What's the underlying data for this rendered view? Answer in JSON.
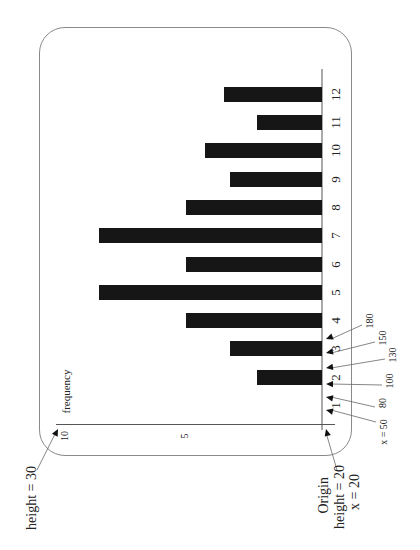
{
  "chart_data": {
    "type": "bar",
    "orientation": "horizontal (rotated page; bars extend left from baseline)",
    "title": "",
    "xlabel": "",
    "ylabel": "frequency",
    "categories": [
      "1",
      "2",
      "3",
      "4",
      "5",
      "6",
      "7",
      "8",
      "9",
      "10",
      "11",
      "12"
    ],
    "values": [
      0,
      2.4,
      3.4,
      5,
      8.2,
      5,
      8.2,
      5,
      3.4,
      4.3,
      2.4,
      3.6
    ],
    "ylim": [
      0,
      10
    ],
    "yticks": [
      "5",
      "10"
    ],
    "grid": false,
    "legend": null,
    "annotations": [
      {
        "text": "height = 30",
        "target": "top of frequency axis (10)"
      },
      {
        "text": "Origin",
        "target": "origin"
      },
      {
        "text": "height = 20",
        "target": "origin"
      },
      {
        "text": "x = 20",
        "target": "origin"
      },
      {
        "text": "x = 50",
        "target": "x position"
      },
      {
        "text": "80",
        "target": "x position"
      },
      {
        "text": "100",
        "target": "x position"
      },
      {
        "text": "130",
        "target": "x position"
      },
      {
        "text": "150",
        "target": "x position"
      },
      {
        "text": "180",
        "target": "x position"
      }
    ]
  },
  "axis": {
    "freq_label": "frequency",
    "tick_5": "5",
    "tick_10": "10"
  },
  "annotations": {
    "height_top": "height = 30",
    "origin": "Origin",
    "origin_height": "height = 20",
    "origin_x": "x = 20",
    "x_positions": [
      {
        "label": "x = 50",
        "arrow_y": 410,
        "text_x": 384,
        "text_y": 432
      },
      {
        "label": "80",
        "arrow_y": 397,
        "text_x": 383,
        "text_y": 403
      },
      {
        "label": "100",
        "arrow_y": 384,
        "text_x": 390,
        "text_y": 381
      },
      {
        "label": "130",
        "arrow_y": 368,
        "text_x": 393,
        "text_y": 355
      },
      {
        "label": "150",
        "arrow_y": 353,
        "text_x": 383,
        "text_y": 338
      },
      {
        "label": "180",
        "arrow_y": 339,
        "text_x": 370,
        "text_y": 321
      }
    ]
  },
  "colors": {
    "bar": "#161616",
    "frame": "#8a8a8a",
    "axis": "#555555",
    "text": "#222222"
  }
}
